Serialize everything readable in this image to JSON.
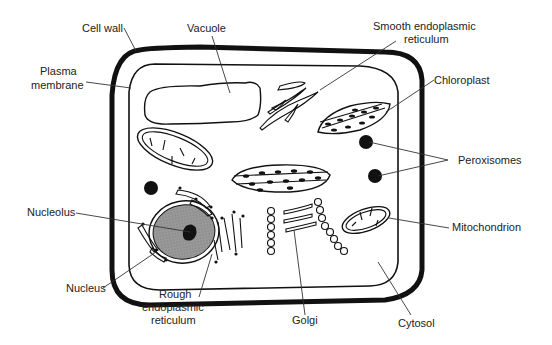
{
  "labels": {
    "cell_wall": "Cell wall",
    "vacuole": "Vacuole",
    "ser_line1": "Smooth endoplasmic",
    "ser_line2": "reticulum",
    "plasma_line1": "Plasma",
    "plasma_line2": "membrane",
    "chloroplast": "Chloroplast",
    "peroxisomes": "Peroxisomes",
    "nucleolus": "Nucleolus",
    "mitochondrion": "Mitochondrion",
    "nucleus": "Nucleus",
    "rer_line1": "Rough",
    "rer_line2": "endoplasmic",
    "rer_line3": "reticulum",
    "golgi": "Golgi",
    "cytosol": "Cytosol"
  },
  "colors": {
    "ink": "#111111",
    "nucleus_fill": "#8a8a8a",
    "background": "#ffffff"
  }
}
